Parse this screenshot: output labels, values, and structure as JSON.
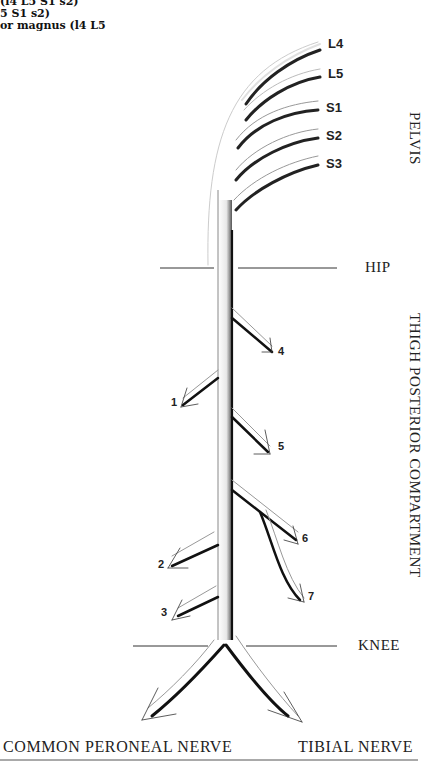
{
  "caption_fragments": [
    "(l4 L5 S1 s2)",
    "5 S1 s2)",
    "or magnus (l4 L5"
  ],
  "root_labels": [
    "L4",
    "L5",
    "S1",
    "S2",
    "S3"
  ],
  "regions": {
    "pelvis": "PELVIS",
    "hip": "HIP",
    "thigh": "THIGH POSTERIOR COMPARTMENT",
    "knee": "KNEE"
  },
  "branch_numbers": [
    "1",
    "2",
    "3",
    "4",
    "5",
    "6",
    "7"
  ],
  "terminal_branches": {
    "left": "COMMON PERONEAL NERVE",
    "right": "TIBIAL NERVE"
  }
}
